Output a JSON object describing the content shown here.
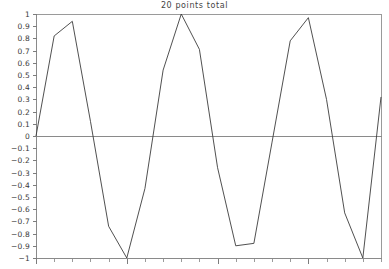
{
  "chart_data": {
    "type": "line",
    "title": "20 points total",
    "xlabel": "",
    "ylabel": "",
    "xlim": [
      0,
      19
    ],
    "ylim": [
      -1,
      1
    ],
    "grid": false,
    "legend": null,
    "y_tick_labels": [
      "1",
      "0.9",
      "0.8",
      "0.7",
      "0.6",
      "0.5",
      "0.4",
      "0.3",
      "0.2",
      "0.1",
      "0",
      "−0.1",
      "−0.2",
      "−0.3",
      "−0.4",
      "−0.5",
      "−0.6",
      "−0.7",
      "−0.8",
      "−0.9",
      "−1"
    ],
    "y_tick_values": [
      1,
      0.9,
      0.8,
      0.7,
      0.6,
      0.5,
      0.4,
      0.3,
      0.2,
      0.1,
      0,
      -0.1,
      -0.2,
      -0.3,
      -0.4,
      -0.5,
      -0.6,
      -0.7,
      -0.8,
      -0.9,
      -1
    ],
    "x_tick_labels": [],
    "x_tick_count": 20,
    "point_count": 20,
    "x": [
      0,
      1,
      2,
      3,
      4,
      5,
      6,
      7,
      8,
      9,
      10,
      11,
      12,
      13,
      14,
      15,
      16,
      17,
      18,
      19
    ],
    "values": [
      0.0,
      0.82,
      0.94,
      0.12,
      -0.74,
      -1.0,
      -0.43,
      0.54,
      1.0,
      0.71,
      -0.26,
      -0.9,
      -0.88,
      -0.05,
      0.78,
      0.97,
      0.3,
      -0.63,
      -1.0,
      0.32
    ],
    "series": [
      {
        "name": "signal",
        "color": "#3c3c3c",
        "values": [
          0.0,
          0.82,
          0.94,
          0.12,
          -0.74,
          -1.0,
          -0.43,
          0.54,
          1.0,
          0.71,
          -0.26,
          -0.9,
          -0.88,
          -0.05,
          0.78,
          0.97,
          0.3,
          -0.63,
          -1.0,
          0.32
        ]
      }
    ],
    "colors": {
      "line": "#3c3c3c",
      "axis": "#8a8a8a",
      "frame": "#9a9a9a",
      "tick": "#7d7d7d",
      "title": "#444444",
      "label": "#3a3a3a",
      "background": "#ffffff"
    },
    "plot_area": {
      "left": 36,
      "top": 14,
      "right": 381,
      "bottom": 258
    }
  }
}
